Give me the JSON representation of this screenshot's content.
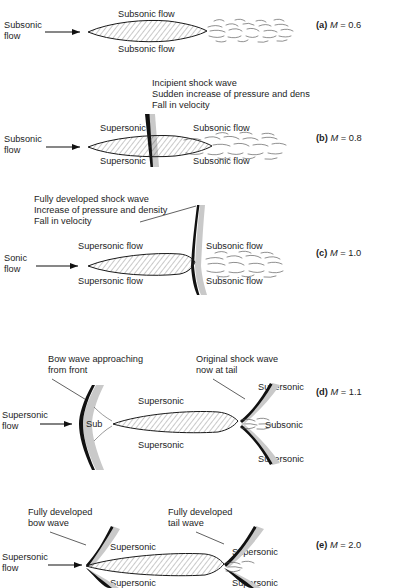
{
  "figure": {
    "type": "technical-diagram",
    "panel_count": 5
  },
  "panels": [
    {
      "id": "a",
      "caption_letter": "(a)",
      "caption_symbol": "M",
      "caption_value": "= 0.6",
      "caption_full": "(a) M = 0.6",
      "mach": 0.6,
      "inflow_label": "Subsonic\nflow",
      "inflow_line1": "Subsonic",
      "inflow_line2": "flow",
      "labels": {
        "upper": "Subsonic flow",
        "lower": "Subsonic flow"
      },
      "annotations": [],
      "features": [
        "aerofoil",
        "turbulent-wake"
      ]
    },
    {
      "id": "b",
      "caption_letter": "(b)",
      "caption_symbol": "M",
      "caption_value": "= 0.8",
      "caption_full": "(b) M = 0.8",
      "mach": 0.8,
      "inflow_line1": "Subsonic",
      "inflow_line2": "flow",
      "labels": {
        "upper_left": "Supersonic",
        "lower_left": "Supersonic",
        "upper_right": "Subsonic flow",
        "lower_right": "Subsonic flow"
      },
      "annotations": [
        "Incipient shock wave",
        "Sudden increase of pressure and density",
        "Fall in velocity"
      ],
      "features": [
        "aerofoil",
        "incipient-shock-wave",
        "turbulent-wake"
      ]
    },
    {
      "id": "c",
      "caption_letter": "(c)",
      "caption_symbol": "M",
      "caption_value": "= 1.0",
      "caption_full": "(c) M = 1.0",
      "mach": 1.0,
      "inflow_line1": "Sonic",
      "inflow_line2": "flow",
      "labels": {
        "upper_left": "Supersonic flow",
        "lower_left": "Supersonic flow",
        "upper_right": "Subsonic flow",
        "lower_right": "Subsonic flow"
      },
      "annotations": [
        "Fully developed shock wave",
        "Increase of pressure and density",
        "Fall in velocity"
      ],
      "features": [
        "aerofoil",
        "fully-developed-shock-wave",
        "turbulent-wake"
      ]
    },
    {
      "id": "d",
      "caption_letter": "(d)",
      "caption_symbol": "M",
      "caption_value": "= 1.1",
      "caption_full": "(d) M = 1.1",
      "mach": 1.1,
      "inflow_line1": "Supersonic",
      "inflow_line2": "flow",
      "labels": {
        "nose_pocket": "Sub",
        "upper_mid": "Supersonic",
        "lower_mid": "Supersonic",
        "upper_right": "Supersonic",
        "mid_right": "Subsonic",
        "lower_right": "Supersonic"
      },
      "annotations": [
        "Bow wave approaching\nfrom front",
        "Original shock wave\nnow at tail"
      ],
      "annotation_left_line1": "Bow wave approaching",
      "annotation_left_line2": "from front",
      "annotation_right_line1": "Original shock wave",
      "annotation_right_line2": "now at tail",
      "features": [
        "aerofoil",
        "detached-bow-wave",
        "tail-shock-wave",
        "subsonic-pocket"
      ]
    },
    {
      "id": "e",
      "caption_letter": "(e)",
      "caption_symbol": "M",
      "caption_value": "= 2.0",
      "caption_full": "(e) M = 2.0",
      "mach": 2.0,
      "inflow_line1": "Supersonic",
      "inflow_line2": "flow",
      "labels": {
        "upper_mid": "Supersonic",
        "lower_mid": "Supersonic",
        "upper_right": "Supersonic",
        "lower_right": "Supersonic"
      },
      "annotation_left_line1": "Fully developed",
      "annotation_left_line2": "bow wave",
      "annotation_right_line1": "Fully developed",
      "annotation_right_line2": "tail wave",
      "features": [
        "aerofoil",
        "attached-bow-wave",
        "attached-tail-wave"
      ]
    }
  ],
  "colors": {
    "ink": "#1a1a1a",
    "shock_dark": "#111111",
    "shock_shading": "#c9c9c9",
    "background": "#ffffff"
  }
}
